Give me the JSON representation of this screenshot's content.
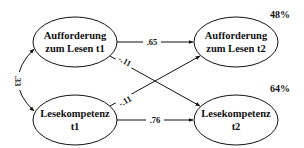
{
  "diagram": {
    "type": "path-model",
    "nodes": [
      {
        "id": "aufforderung_t1",
        "lines": [
          "Aufforderung",
          "zum Lesen t1"
        ]
      },
      {
        "id": "lesekompetenz_t1",
        "lines": [
          "Lesekompetenz",
          "t1"
        ]
      },
      {
        "id": "aufforderung_t2",
        "lines": [
          "Aufforderung",
          "zum Lesen t2"
        ],
        "r2": "48%"
      },
      {
        "id": "lesekompetenz_t2",
        "lines": [
          "Lesekompetenz",
          "t2"
        ],
        "r2": "64%"
      }
    ],
    "paths": [
      {
        "from": "aufforderung_t1",
        "to": "aufforderung_t2",
        "label": ".65"
      },
      {
        "from": "lesekompetenz_t1",
        "to": "lesekompetenz_t2",
        "label": ".76"
      },
      {
        "from": "aufforderung_t1",
        "to": "lesekompetenz_t2",
        "label": "-.11"
      },
      {
        "from": "lesekompetenz_t1",
        "to": "aufforderung_t2",
        "label": "-.11"
      },
      {
        "from": "aufforderung_t1",
        "to": "lesekompetenz_t1",
        "label": ".33",
        "type": "correlation"
      }
    ],
    "colors": {
      "stroke": "#111111",
      "background": "#ffffff"
    }
  }
}
